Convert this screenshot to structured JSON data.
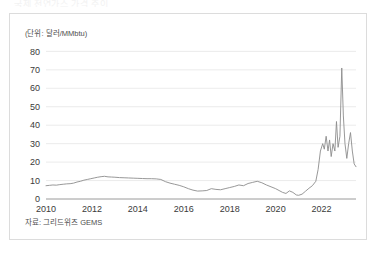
{
  "cut_title": "국제 천연가스 가격 추이",
  "unit_label": "(단위: 달러/MMbtu)",
  "source_note": "자료: 그리드위즈 GEMS",
  "colors": {
    "line": "#8c8c8c",
    "grid": "#e3e3e3",
    "axis": "#9a9a9a",
    "frame": "#dcdcdc",
    "text": "#3a3a3a"
  },
  "chart_data": {
    "type": "line",
    "title": "국제 천연가스 가격 추이",
    "xlabel": "",
    "ylabel": "(단위: 달러/MMbtu)",
    "xlim": [
      2010,
      2023.5
    ],
    "ylim": [
      0,
      84
    ],
    "grid": true,
    "legend": "none",
    "ytick_labels": [
      "0",
      "10",
      "20",
      "30",
      "40",
      "50",
      "60",
      "70",
      "80"
    ],
    "ytick_values": [
      0,
      10,
      20,
      30,
      40,
      50,
      60,
      70,
      80
    ],
    "xtick_labels": [
      "2010",
      "2012",
      "2014",
      "2016",
      "2018",
      "2020",
      "2022"
    ],
    "xtick_values": [
      2010,
      2012,
      2014,
      2016,
      2018,
      2020,
      2022
    ],
    "series": [
      {
        "name": "천연가스 가격",
        "color": "#8c8c8c",
        "x": [
          2010.0,
          2010.15,
          2010.3,
          2010.45,
          2010.6,
          2010.75,
          2010.9,
          2011.05,
          2011.2,
          2011.35,
          2011.5,
          2011.65,
          2011.8,
          2011.95,
          2012.1,
          2012.25,
          2012.4,
          2012.55,
          2012.7,
          2012.85,
          2013.0,
          2013.2,
          2013.4,
          2013.6,
          2013.8,
          2014.0,
          2014.2,
          2014.4,
          2014.6,
          2014.8,
          2015.0,
          2015.2,
          2015.4,
          2015.6,
          2015.8,
          2016.0,
          2016.2,
          2016.4,
          2016.6,
          2016.8,
          2017.0,
          2017.2,
          2017.4,
          2017.6,
          2017.8,
          2018.0,
          2018.2,
          2018.4,
          2018.6,
          2018.8,
          2019.0,
          2019.2,
          2019.4,
          2019.6,
          2019.8,
          2020.0,
          2020.15,
          2020.3,
          2020.45,
          2020.6,
          2020.75,
          2020.9,
          2021.0,
          2021.15,
          2021.3,
          2021.45,
          2021.6,
          2021.75,
          2021.85,
          2021.95,
          2022.05,
          2022.12,
          2022.2,
          2022.28,
          2022.35,
          2022.42,
          2022.5,
          2022.58,
          2022.65,
          2022.72,
          2022.8,
          2022.88,
          2022.95,
          2023.02,
          2023.1,
          2023.18,
          2023.26,
          2023.34,
          2023.42,
          2023.5
        ],
        "y": [
          7.2,
          7.4,
          7.6,
          7.5,
          7.8,
          8.0,
          8.2,
          8.3,
          8.6,
          9.2,
          9.6,
          10.2,
          10.6,
          11.0,
          11.4,
          11.8,
          12.1,
          12.3,
          12.0,
          11.9,
          11.8,
          11.6,
          11.5,
          11.4,
          11.3,
          11.2,
          11.1,
          11.0,
          11.0,
          10.9,
          10.6,
          9.4,
          8.6,
          8.0,
          7.4,
          6.6,
          5.6,
          4.8,
          4.3,
          4.4,
          4.6,
          5.6,
          5.2,
          5.0,
          5.6,
          6.2,
          6.8,
          7.6,
          7.2,
          8.4,
          9.0,
          9.6,
          8.8,
          7.6,
          6.6,
          5.6,
          4.6,
          3.6,
          3.0,
          4.4,
          3.6,
          2.2,
          2.0,
          2.6,
          4.2,
          5.8,
          7.2,
          9.6,
          16.0,
          26.0,
          30.0,
          27.0,
          34.0,
          26.0,
          32.0,
          23.0,
          30.0,
          26.0,
          42.0,
          28.0,
          34.0,
          71.0,
          45.0,
          30.0,
          22.0,
          30.0,
          36.0,
          26.0,
          19.0,
          17.5
        ]
      }
    ]
  }
}
